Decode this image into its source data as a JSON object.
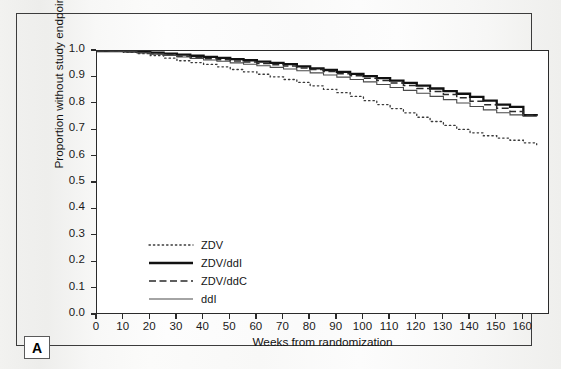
{
  "figure": {
    "panel_label": "A"
  },
  "chart_data": {
    "type": "line",
    "title": "",
    "subtitle": "",
    "xlabel": "Weeks from randomization",
    "ylabel": "Proportion without study endpoint",
    "xlim": [
      0,
      170
    ],
    "ylim": [
      0.0,
      1.0
    ],
    "grid": false,
    "legend_position": "inside-lower-left",
    "xticks": [
      0,
      10,
      20,
      30,
      40,
      50,
      60,
      70,
      80,
      90,
      100,
      110,
      120,
      130,
      140,
      150,
      160
    ],
    "xtick_labels": [
      "0",
      "10",
      "20",
      "30",
      "40",
      "50",
      "60",
      "70",
      "80",
      "90",
      "100",
      "110",
      "120",
      "130",
      "140",
      "150",
      "160"
    ],
    "yticks": [
      0.0,
      0.1,
      0.2,
      0.3,
      0.4,
      0.5,
      0.6,
      0.7,
      0.8,
      0.9,
      1.0
    ],
    "ytick_labels": [
      "0.0",
      "0.1",
      "0.2",
      "0.3",
      "0.4",
      "0.5",
      "0.6",
      "0.7",
      "0.8",
      "0.9",
      "1.0"
    ],
    "x": [
      0,
      5,
      10,
      15,
      20,
      25,
      30,
      35,
      40,
      45,
      50,
      55,
      60,
      65,
      70,
      75,
      80,
      85,
      90,
      95,
      100,
      105,
      110,
      115,
      120,
      125,
      130,
      135,
      140,
      145,
      150,
      155,
      160,
      165
    ],
    "series": [
      {
        "name": "ZDV",
        "style": "dotted",
        "color": "#3a3a3a",
        "width": 1.3,
        "values": [
          1.0,
          0.999,
          0.996,
          0.99,
          0.983,
          0.973,
          0.963,
          0.956,
          0.949,
          0.94,
          0.93,
          0.921,
          0.912,
          0.902,
          0.892,
          0.881,
          0.868,
          0.855,
          0.842,
          0.828,
          0.812,
          0.797,
          0.782,
          0.766,
          0.749,
          0.733,
          0.718,
          0.703,
          0.69,
          0.679,
          0.67,
          0.662,
          0.652,
          0.645
        ]
      },
      {
        "name": "ZDV/ddI",
        "style": "solid-thick",
        "color": "#111111",
        "width": 2.3,
        "values": [
          1.0,
          1.0,
          0.999,
          0.997,
          0.994,
          0.99,
          0.986,
          0.982,
          0.978,
          0.974,
          0.969,
          0.965,
          0.96,
          0.955,
          0.95,
          0.942,
          0.934,
          0.928,
          0.921,
          0.913,
          0.905,
          0.897,
          0.888,
          0.879,
          0.869,
          0.858,
          0.848,
          0.838,
          0.826,
          0.812,
          0.797,
          0.788,
          0.757,
          0.755
        ]
      },
      {
        "name": "ZDV/ddC",
        "style": "dashed",
        "color": "#2a2a2a",
        "width": 1.5,
        "values": [
          1.0,
          0.999,
          0.997,
          0.994,
          0.99,
          0.985,
          0.98,
          0.975,
          0.971,
          0.967,
          0.962,
          0.958,
          0.953,
          0.948,
          0.943,
          0.936,
          0.93,
          0.922,
          0.914,
          0.906,
          0.897,
          0.888,
          0.879,
          0.869,
          0.858,
          0.847,
          0.835,
          0.823,
          0.81,
          0.796,
          0.783,
          0.771,
          0.757,
          0.755
        ]
      },
      {
        "name": "ddI",
        "style": "solid-thin",
        "color": "#4a4a4a",
        "width": 1.1,
        "values": [
          1.0,
          0.999,
          0.997,
          0.993,
          0.988,
          0.983,
          0.977,
          0.972,
          0.966,
          0.961,
          0.955,
          0.95,
          0.944,
          0.938,
          0.932,
          0.925,
          0.917,
          0.909,
          0.901,
          0.892,
          0.883,
          0.873,
          0.862,
          0.851,
          0.84,
          0.828,
          0.816,
          0.803,
          0.79,
          0.777,
          0.766,
          0.758,
          0.753,
          0.752
        ]
      }
    ],
    "legend": [
      {
        "label": "ZDV",
        "style": "dotted"
      },
      {
        "label": "ZDV/ddI",
        "style": "solid-thick"
      },
      {
        "label": "ZDV/ddC",
        "style": "dashed"
      },
      {
        "label": "ddI",
        "style": "solid-thin"
      }
    ]
  }
}
